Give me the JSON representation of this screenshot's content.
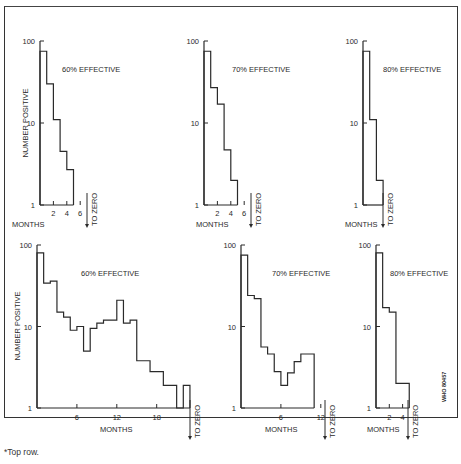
{
  "figure": {
    "footnote": "*Top row.",
    "code": "WHO 80457",
    "y_axis_label": "NUMBER POSITIVE",
    "x_axis_label": "MONTHS",
    "to_zero_label": "TO ZERO"
  },
  "chart_data": [
    {
      "type": "line",
      "subtype": "step",
      "row": "top",
      "title": "60% EFFECTIVE",
      "xlabel": "MONTHS",
      "ylabel": "NUMBER POSITIVE",
      "yscale": "log",
      "ylim": [
        1,
        100
      ],
      "xticks": [
        2,
        4,
        6
      ],
      "yticks": [
        1,
        10,
        100
      ],
      "steps": [
        {
          "x0": 0,
          "x1": 1,
          "y": 75
        },
        {
          "x0": 1,
          "x1": 2,
          "y": 30
        },
        {
          "x0": 2,
          "x1": 3,
          "y": 11
        },
        {
          "x0": 3,
          "x1": 4,
          "y": 4.5
        },
        {
          "x0": 4,
          "x1": 5,
          "y": 2.7
        }
      ],
      "annotation": "TO ZERO at month 6"
    },
    {
      "type": "line",
      "subtype": "step",
      "row": "top",
      "title": "70% EFFECTIVE",
      "xlabel": "MONTHS",
      "yscale": "log",
      "ylim": [
        1,
        100
      ],
      "xticks": [
        2,
        4,
        6
      ],
      "yticks": [
        1,
        10,
        100
      ],
      "steps": [
        {
          "x0": 0,
          "x1": 1,
          "y": 75
        },
        {
          "x0": 1,
          "x1": 2,
          "y": 27
        },
        {
          "x0": 2,
          "x1": 3,
          "y": 17
        },
        {
          "x0": 3,
          "x1": 4,
          "y": 4.7
        },
        {
          "x0": 4,
          "x1": 5,
          "y": 2
        }
      ],
      "annotation": "TO ZERO at month 6"
    },
    {
      "type": "line",
      "subtype": "step",
      "row": "top",
      "title": "80% EFFECTIVE",
      "xlabel": "MONTHS",
      "yscale": "log",
      "ylim": [
        1,
        100
      ],
      "yticks": [
        1,
        10,
        100
      ],
      "steps": [
        {
          "x0": 0,
          "x1": 1,
          "y": 75
        },
        {
          "x0": 1,
          "x1": 2,
          "y": 11
        },
        {
          "x0": 2,
          "x1": 3,
          "y": 2
        }
      ],
      "annotation": "TO ZERO at month 3"
    },
    {
      "type": "line",
      "subtype": "step",
      "row": "bottom",
      "title": "60% EFFECTIVE",
      "xlabel": "MONTHS",
      "ylabel": "NUMBER POSITIVE",
      "yscale": "log",
      "ylim": [
        1,
        100
      ],
      "xticks": [
        6,
        12,
        18
      ],
      "yticks": [
        1,
        10,
        100
      ],
      "steps": [
        {
          "x0": 0,
          "x1": 1,
          "y": 80
        },
        {
          "x0": 1,
          "x1": 2,
          "y": 34
        },
        {
          "x0": 2,
          "x1": 3,
          "y": 36
        },
        {
          "x0": 3,
          "x1": 4,
          "y": 15
        },
        {
          "x0": 4,
          "x1": 5,
          "y": 13
        },
        {
          "x0": 5,
          "x1": 6,
          "y": 9
        },
        {
          "x0": 6,
          "x1": 7,
          "y": 10
        },
        {
          "x0": 7,
          "x1": 8,
          "y": 5
        },
        {
          "x0": 8,
          "x1": 9,
          "y": 9.5
        },
        {
          "x0": 9,
          "x1": 10,
          "y": 11
        },
        {
          "x0": 10,
          "x1": 11,
          "y": 12
        },
        {
          "x0": 11,
          "x1": 12,
          "y": 12
        },
        {
          "x0": 12,
          "x1": 13,
          "y": 21
        },
        {
          "x0": 13,
          "x1": 14,
          "y": 11
        },
        {
          "x0": 14,
          "x1": 15,
          "y": 12
        },
        {
          "x0": 15,
          "x1": 16,
          "y": 3.8
        },
        {
          "x0": 16,
          "x1": 17,
          "y": 3.8
        },
        {
          "x0": 17,
          "x1": 18,
          "y": 2.8
        },
        {
          "x0": 18,
          "x1": 19,
          "y": 2.8
        },
        {
          "x0": 19,
          "x1": 20,
          "y": 1.9
        },
        {
          "x0": 20,
          "x1": 21,
          "y": 1.9
        },
        {
          "x0": 21,
          "x1": 22,
          "y": 1
        },
        {
          "x0": 22,
          "x1": 23,
          "y": 1.9
        }
      ],
      "annotation": "TO ZERO at month 24"
    },
    {
      "type": "line",
      "subtype": "step",
      "row": "bottom",
      "title": "70% EFFECTIVE",
      "xlabel": "MONTHS",
      "yscale": "log",
      "ylim": [
        1,
        100
      ],
      "xticks": [
        6,
        12
      ],
      "yticks": [
        1,
        10,
        100
      ],
      "steps": [
        {
          "x0": 0,
          "x1": 1,
          "y": 75
        },
        {
          "x0": 1,
          "x1": 2,
          "y": 24
        },
        {
          "x0": 2,
          "x1": 3,
          "y": 22
        },
        {
          "x0": 3,
          "x1": 4,
          "y": 5.6
        },
        {
          "x0": 4,
          "x1": 5,
          "y": 4.6
        },
        {
          "x0": 5,
          "x1": 6,
          "y": 2.8
        },
        {
          "x0": 6,
          "x1": 7,
          "y": 1.9
        },
        {
          "x0": 7,
          "x1": 8,
          "y": 2.7
        },
        {
          "x0": 8,
          "x1": 9,
          "y": 3.7
        },
        {
          "x0": 9,
          "x1": 11,
          "y": 4.6
        }
      ],
      "annotation": "TO ZERO at month 13"
    },
    {
      "type": "line",
      "subtype": "step",
      "row": "bottom",
      "title": "80% EFFECTIVE",
      "xlabel": "MONTHS",
      "yscale": "log",
      "ylim": [
        1,
        100
      ],
      "xticks": [
        2,
        4
      ],
      "yticks": [
        1,
        10,
        100
      ],
      "steps": [
        {
          "x0": 0,
          "x1": 1,
          "y": 80
        },
        {
          "x0": 1,
          "x1": 2,
          "y": 17
        },
        {
          "x0": 2,
          "x1": 3,
          "y": 15
        },
        {
          "x0": 3,
          "x1": 5,
          "y": 2
        }
      ],
      "annotation": "TO ZERO at month 5"
    }
  ],
  "panels_layout": [
    {
      "ox": 40,
      "y100": 41,
      "y1": 205,
      "pxm": 6.7,
      "title_x": 62,
      "title_y": 72,
      "ylabel": true,
      "ylabel_x": 28,
      "ylabel_y": 123,
      "months_x": 12,
      "months_y": 227,
      "tz_x": 87,
      "tz_top": 193,
      "tz_bot": 228,
      "xlabels_y": 216
    },
    {
      "ox": 204,
      "y100": 41,
      "y1": 205,
      "pxm": 6.7,
      "title_x": 232,
      "title_y": 72,
      "ylabel": false,
      "months_x": 196,
      "months_y": 227,
      "tz_x": 251,
      "tz_top": 193,
      "tz_bot": 228,
      "xlabels_y": 216
    },
    {
      "ox": 363,
      "y100": 41,
      "y1": 205,
      "pxm": 6.7,
      "title_x": 383,
      "title_y": 72,
      "ylabel": false,
      "months_x": 345,
      "months_y": 227,
      "tz_x": 383,
      "tz_top": 193,
      "tz_bot": 228,
      "xlabels_y": 216
    },
    {
      "ox": 37,
      "y100": 245,
      "y1": 408,
      "pxm": 6.65,
      "title_x": 81,
      "title_y": 276,
      "ylabel": true,
      "ylabel_x": 20,
      "ylabel_y": 326,
      "months_x": 100,
      "months_y": 432,
      "tz_x": 190,
      "tz_top": 400,
      "tz_bot": 440,
      "xlabels_y": 420
    },
    {
      "ox": 241,
      "y100": 245,
      "y1": 408,
      "pxm": 6.65,
      "title_x": 272,
      "title_y": 276,
      "ylabel": false,
      "months_x": 265,
      "months_y": 432,
      "tz_x": 325,
      "tz_top": 400,
      "tz_bot": 440,
      "xlabels_y": 420
    },
    {
      "ox": 376,
      "y100": 245,
      "y1": 408,
      "pxm": 6.65,
      "title_x": 390,
      "title_y": 276,
      "ylabel": false,
      "months_x": 367,
      "months_y": 432,
      "tz_x": 408,
      "tz_top": 400,
      "tz_bot": 440,
      "xlabels_y": 420
    }
  ]
}
